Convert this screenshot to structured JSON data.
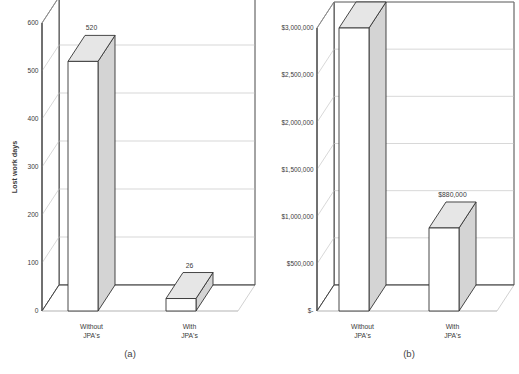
{
  "figure": {
    "panels": [
      {
        "caption": "(a)"
      },
      {
        "caption": "(b)"
      }
    ]
  },
  "chart_data": [
    {
      "type": "bar",
      "panel": "(a)",
      "title": "",
      "xlabel": "",
      "ylabel": "Lost work days",
      "categories": [
        "Without JPA's",
        "With JPA's"
      ],
      "category_lines": [
        [
          "Without",
          "JPA's"
        ],
        [
          "With",
          "JPA's"
        ]
      ],
      "values": [
        520,
        26
      ],
      "data_labels": [
        "520",
        "26"
      ],
      "ylim": [
        0,
        600
      ],
      "yticks": [
        0,
        100,
        200,
        300,
        400,
        500,
        600
      ],
      "ytick_labels": [
        "0",
        "100",
        "200",
        "300",
        "400",
        "500",
        "600"
      ],
      "grid": true,
      "legend": "none",
      "three_d": true,
      "bar_face_color": "#ffffff",
      "bar_side_color": "#d4d4d4",
      "bar_top_color": "#e6e6e6",
      "line_color": "#333333",
      "grid_color": "#bdbdbd"
    },
    {
      "type": "bar",
      "panel": "(b)",
      "title": "",
      "xlabel": "",
      "ylabel": "",
      "categories": [
        "Without JPA's",
        "With JPA's"
      ],
      "category_lines": [
        [
          "Without",
          "JPA's"
        ],
        [
          "With",
          "JPA's"
        ]
      ],
      "values": [
        3000000,
        880000
      ],
      "data_labels": [
        "$3,000,000",
        "$880,000"
      ],
      "ylim": [
        0,
        3000000
      ],
      "yticks": [
        0,
        500000,
        1000000,
        1500000,
        2000000,
        2500000,
        3000000
      ],
      "ytick_labels": [
        "$-",
        "$500,000",
        "$1,000,000",
        "$1,500,000",
        "$2,000,000",
        "$2,500,000",
        "$3,000,000"
      ],
      "grid": true,
      "legend": "none",
      "three_d": true,
      "bar_face_color": "#ffffff",
      "bar_side_color": "#d4d4d4",
      "bar_top_color": "#e6e6e6",
      "line_color": "#333333",
      "grid_color": "#bdbdbd"
    }
  ]
}
